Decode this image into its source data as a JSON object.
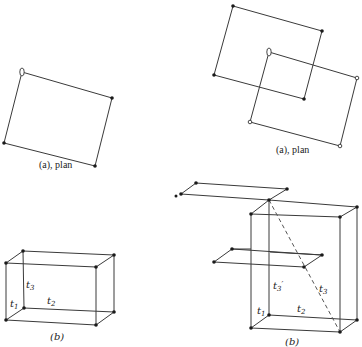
{
  "figure": {
    "left": {
      "plan": {
        "caption": "(a), plan",
        "square_corners": [
          [
            22,
            72
          ],
          [
            112,
            98
          ],
          [
            95,
            166
          ],
          [
            4,
            143
          ]
        ],
        "ellipse_marker_corner": "top-left"
      },
      "box": {
        "caption": "(b)",
        "labels": {
          "t1": "t1",
          "t2": "t2",
          "t3": "t3"
        }
      }
    },
    "right": {
      "plan": {
        "caption": "(a), plan",
        "black_square": [
          [
            233,
            6
          ],
          [
            322,
            31
          ],
          [
            304,
            99
          ],
          [
            214,
            75
          ]
        ],
        "white_square": [
          [
            269,
            52
          ],
          [
            357,
            78
          ],
          [
            340,
            146
          ],
          [
            250,
            122
          ]
        ],
        "ellipse_marker_corner": "white-square top-left"
      },
      "box": {
        "caption": "(b)",
        "labels": {
          "t1": "t1",
          "t2": "t2",
          "t3": "t3",
          "t3_prime": "t3′"
        },
        "dashed_diagonal": "from top back-left corner to bottom front-right corner"
      }
    }
  },
  "text": {
    "left_plan_caption": "(a), plan",
    "right_plan_caption": "(a), plan",
    "left_box_caption": "(b)",
    "right_box_caption": "(b)",
    "t1": "t",
    "t1_sub": "1",
    "t2": "t",
    "t2_sub": "2",
    "t3": "t",
    "t3_sub": "3",
    "t3p_sub": "3",
    "prime": "′"
  }
}
